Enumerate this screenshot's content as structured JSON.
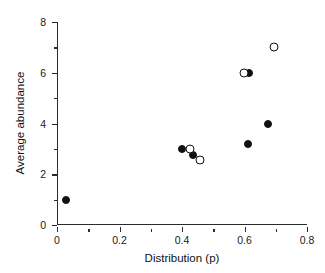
{
  "chart_data": {
    "type": "scatter",
    "title": "",
    "xlabel": "Distribution (p)",
    "ylabel": "Average abundance",
    "xlim": [
      0,
      0.8
    ],
    "ylim": [
      0,
      8
    ],
    "grid": false,
    "legend": "none",
    "x_ticks": [
      "0",
      "0.2",
      "0.4",
      "0.6",
      "0.8"
    ],
    "x_tick_values": [
      0,
      0.2,
      0.4,
      0.6,
      0.8
    ],
    "x_minor_tick_values": [
      0.1,
      0.3,
      0.5,
      0.7
    ],
    "y_ticks": [
      "0",
      "2",
      "4",
      "6",
      "8"
    ],
    "y_tick_values": [
      0,
      2,
      4,
      6,
      8
    ],
    "y_minor_tick_values": [
      1,
      3,
      5,
      7
    ],
    "series": [
      {
        "name": "filled",
        "marker": "filled-circle",
        "color": "#111111",
        "points": [
          {
            "x": 0.03,
            "y": 1.0
          },
          {
            "x": 0.4,
            "y": 3.0
          },
          {
            "x": 0.435,
            "y": 2.75
          },
          {
            "x": 0.61,
            "y": 3.2
          },
          {
            "x": 0.615,
            "y": 6.0
          },
          {
            "x": 0.675,
            "y": 4.0
          }
        ]
      },
      {
        "name": "open",
        "marker": "open-circle",
        "color": "#111111",
        "points": [
          {
            "x": 0.425,
            "y": 3.0
          },
          {
            "x": 0.458,
            "y": 2.55
          },
          {
            "x": 0.598,
            "y": 6.0
          },
          {
            "x": 0.695,
            "y": 7.0
          }
        ]
      }
    ]
  }
}
